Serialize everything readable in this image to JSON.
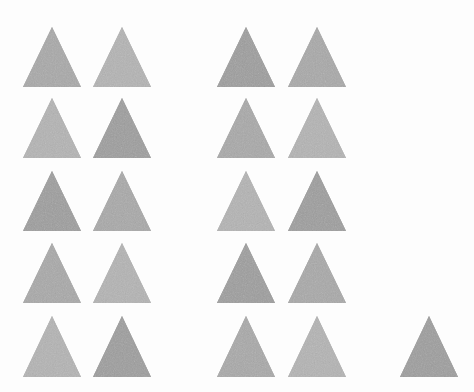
{
  "image": {
    "kind": "counting-estimation-stimulus",
    "title": "Array of gray triangles",
    "width": 474,
    "height": 392,
    "background_color": "#fdfdfd",
    "total_shape_count": 21
  },
  "palette": {
    "shape_fill": "#a9a9a9",
    "shape_fill_light": "#b4b4b4",
    "shape_fill_dark": "#9e9e9e",
    "background": "#fdfdfd"
  },
  "shape_style": {
    "name": "equilateral-triangle",
    "orientation": "apex-up",
    "base_width": 58,
    "height": 60,
    "edge": "soft",
    "texture": "fine-noise"
  },
  "groups": [
    {
      "name": "left-cluster",
      "rows": 5,
      "columns": 2,
      "count": 10,
      "column_centers_x": [
        52,
        122
      ],
      "row_apex_y": [
        27,
        98,
        171,
        243,
        316
      ]
    },
    {
      "name": "right-cluster",
      "rows": 5,
      "columns": 2,
      "count": 10,
      "column_centers_x": [
        246,
        317
      ],
      "row_apex_y": [
        27,
        98,
        171,
        243,
        316
      ]
    },
    {
      "name": "far-right-single",
      "rows": 1,
      "columns": 1,
      "count": 1,
      "column_centers_x": [
        429
      ],
      "row_apex_y": [
        316
      ]
    }
  ],
  "triangles": [
    {
      "id": "tri-r1-c1",
      "group": "left-cluster",
      "row": 1,
      "col": 1,
      "cx": 52,
      "apex_y": 27,
      "base_y": 87
    },
    {
      "id": "tri-r1-c2",
      "group": "left-cluster",
      "row": 1,
      "col": 2,
      "cx": 122,
      "apex_y": 27,
      "base_y": 87
    },
    {
      "id": "tri-r1-c3",
      "group": "right-cluster",
      "row": 1,
      "col": 3,
      "cx": 246,
      "apex_y": 27,
      "base_y": 87
    },
    {
      "id": "tri-r1-c4",
      "group": "right-cluster",
      "row": 1,
      "col": 4,
      "cx": 317,
      "apex_y": 27,
      "base_y": 87
    },
    {
      "id": "tri-r2-c1",
      "group": "left-cluster",
      "row": 2,
      "col": 1,
      "cx": 52,
      "apex_y": 98,
      "base_y": 158
    },
    {
      "id": "tri-r2-c2",
      "group": "left-cluster",
      "row": 2,
      "col": 2,
      "cx": 122,
      "apex_y": 98,
      "base_y": 158
    },
    {
      "id": "tri-r2-c3",
      "group": "right-cluster",
      "row": 2,
      "col": 3,
      "cx": 246,
      "apex_y": 98,
      "base_y": 158
    },
    {
      "id": "tri-r2-c4",
      "group": "right-cluster",
      "row": 2,
      "col": 4,
      "cx": 317,
      "apex_y": 98,
      "base_y": 158
    },
    {
      "id": "tri-r3-c1",
      "group": "left-cluster",
      "row": 3,
      "col": 1,
      "cx": 52,
      "apex_y": 171,
      "base_y": 231
    },
    {
      "id": "tri-r3-c2",
      "group": "left-cluster",
      "row": 3,
      "col": 2,
      "cx": 122,
      "apex_y": 171,
      "base_y": 231
    },
    {
      "id": "tri-r3-c3",
      "group": "right-cluster",
      "row": 3,
      "col": 3,
      "cx": 246,
      "apex_y": 171,
      "base_y": 231
    },
    {
      "id": "tri-r3-c4",
      "group": "right-cluster",
      "row": 3,
      "col": 4,
      "cx": 317,
      "apex_y": 171,
      "base_y": 231
    },
    {
      "id": "tri-r4-c1",
      "group": "left-cluster",
      "row": 4,
      "col": 1,
      "cx": 52,
      "apex_y": 243,
      "base_y": 303
    },
    {
      "id": "tri-r4-c2",
      "group": "left-cluster",
      "row": 4,
      "col": 2,
      "cx": 122,
      "apex_y": 243,
      "base_y": 303
    },
    {
      "id": "tri-r4-c3",
      "group": "right-cluster",
      "row": 4,
      "col": 3,
      "cx": 246,
      "apex_y": 243,
      "base_y": 303
    },
    {
      "id": "tri-r4-c4",
      "group": "right-cluster",
      "row": 4,
      "col": 4,
      "cx": 317,
      "apex_y": 243,
      "base_y": 303
    },
    {
      "id": "tri-r5-c1",
      "group": "left-cluster",
      "row": 5,
      "col": 1,
      "cx": 52,
      "apex_y": 316,
      "base_y": 377
    },
    {
      "id": "tri-r5-c2",
      "group": "left-cluster",
      "row": 5,
      "col": 2,
      "cx": 122,
      "apex_y": 316,
      "base_y": 377
    },
    {
      "id": "tri-r5-c3",
      "group": "right-cluster",
      "row": 5,
      "col": 3,
      "cx": 246,
      "apex_y": 316,
      "base_y": 377
    },
    {
      "id": "tri-r5-c4",
      "group": "right-cluster",
      "row": 5,
      "col": 4,
      "cx": 317,
      "apex_y": 316,
      "base_y": 377
    },
    {
      "id": "tri-r5-c5",
      "group": "far-right-single",
      "row": 5,
      "col": 5,
      "cx": 429,
      "apex_y": 316,
      "base_y": 377
    }
  ]
}
